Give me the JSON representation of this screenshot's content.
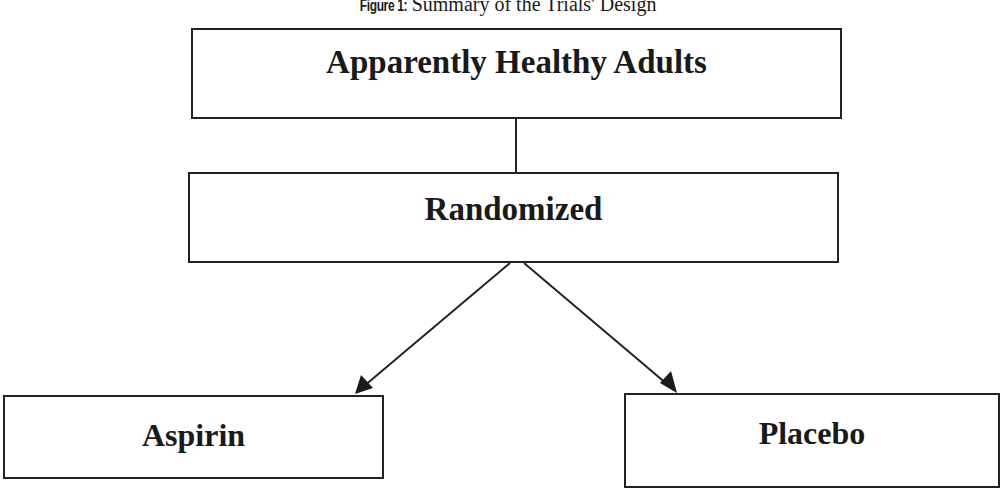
{
  "figure": {
    "caption_label": "Figure 1:",
    "caption_text": " Summary of the Trials' Design"
  },
  "nodes": {
    "adults": {
      "label": "Apparently Healthy Adults"
    },
    "randomized": {
      "label": "Randomized"
    },
    "aspirin": {
      "label": "Aspirin"
    },
    "placebo": {
      "label": "Placebo"
    }
  },
  "edges": [
    {
      "from": "Apparently Healthy Adults",
      "to": "Randomized",
      "style": "line"
    },
    {
      "from": "Randomized",
      "to": "Aspirin",
      "style": "arrow"
    },
    {
      "from": "Randomized",
      "to": "Placebo",
      "style": "arrow"
    }
  ],
  "colors": {
    "stroke": "#222222",
    "text": "#1a1a1a",
    "background": "#ffffff"
  }
}
